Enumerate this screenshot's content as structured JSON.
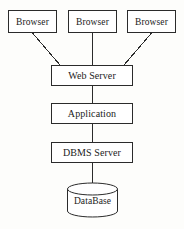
{
  "diagram": {
    "type": "block-diagram",
    "style": {
      "stroke_color": "#2b2b2b",
      "fill_color": "#ffffff",
      "background": "#fdfdfb",
      "text_color": "#1b1b1b",
      "stroke_width": 1
    },
    "nodes": [
      {
        "id": "browser-1",
        "label": "Browser",
        "shape": "rectangle",
        "x": 8,
        "y": 10,
        "w": 49,
        "h": 23
      },
      {
        "id": "browser-2",
        "label": "Browser",
        "shape": "rectangle",
        "x": 68,
        "y": 10,
        "w": 49,
        "h": 23
      },
      {
        "id": "browser-3",
        "label": "Browser",
        "shape": "rectangle",
        "x": 127,
        "y": 10,
        "w": 49,
        "h": 23
      },
      {
        "id": "web-server",
        "label": "Web Server",
        "shape": "rectangle",
        "x": 51,
        "y": 65,
        "w": 82,
        "h": 21
      },
      {
        "id": "application",
        "label": "Application",
        "shape": "rectangle",
        "x": 51,
        "y": 103,
        "w": 82,
        "h": 21
      },
      {
        "id": "dbms-server",
        "label": "DBMS Server",
        "shape": "rectangle",
        "x": 51,
        "y": 142,
        "w": 82,
        "h": 21
      },
      {
        "id": "database",
        "label": "DataBase",
        "shape": "cylinder",
        "x": 67,
        "y": 183,
        "w": 51,
        "h": 34
      }
    ],
    "edges": [
      {
        "id": "edge-browser1-web",
        "from": "browser-1",
        "to": "web-server",
        "kind": "diagonal-line"
      },
      {
        "id": "edge-browser2-web",
        "from": "browser-2",
        "to": "web-server",
        "kind": "vertical-line"
      },
      {
        "id": "edge-browser3-web",
        "from": "browser-3",
        "to": "web-server",
        "kind": "diagonal-line"
      },
      {
        "id": "edge-web-app",
        "from": "web-server",
        "to": "application",
        "kind": "vertical-line"
      },
      {
        "id": "edge-app-dbms",
        "from": "application",
        "to": "dbms-server",
        "kind": "vertical-line"
      },
      {
        "id": "edge-dbms-database",
        "from": "dbms-server",
        "to": "database",
        "kind": "vertical-line"
      }
    ]
  }
}
